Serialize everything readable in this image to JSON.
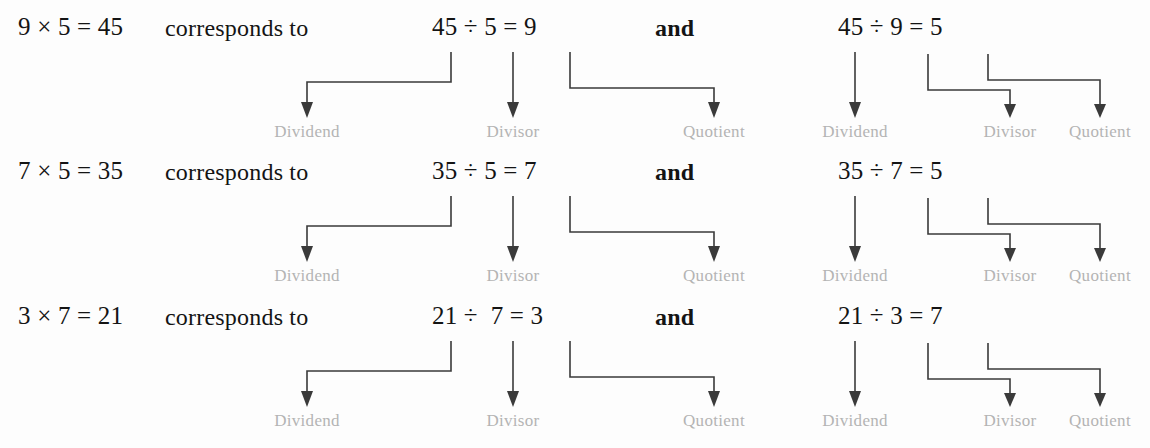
{
  "page": {
    "background_color": "#fdfdfd",
    "text_color": "#141414",
    "label_color": "#b4b4b4",
    "arrow_color": "#3a3a3a"
  },
  "labels": {
    "dividend": "Dividend",
    "divisor": "Divisor",
    "quotient": "Quotient"
  },
  "connectors": {
    "phrase": "corresponds to",
    "conjunction": "and"
  },
  "rows": [
    {
      "multiplication": "9 × 5 = 45",
      "phrase": "corresponds to",
      "division_a": "45 ÷ 5 = 9",
      "conjunction": "and",
      "division_b": "45 ÷ 9 = 5",
      "labels_a": {
        "dividend": "Dividend",
        "divisor": "Divisor",
        "quotient": "Quotient"
      },
      "labels_b": {
        "dividend": "Dividend",
        "divisor": "Divisor",
        "quotient": "Quotient"
      }
    },
    {
      "multiplication": "7 × 5 = 35",
      "phrase": "corresponds to",
      "division_a": "35 ÷ 5 = 7",
      "conjunction": "and",
      "division_b": "35 ÷ 7 = 5",
      "labels_a": {
        "dividend": "Dividend",
        "divisor": "Divisor",
        "quotient": "Quotient"
      },
      "labels_b": {
        "dividend": "Dividend",
        "divisor": "Divisor",
        "quotient": "Quotient"
      }
    },
    {
      "multiplication": "3 × 7 = 21",
      "phrase": "corresponds to",
      "division_a": "21 ÷  7 = 3",
      "conjunction": "and",
      "division_b": "21 ÷ 3 = 7",
      "labels_a": {
        "dividend": "Dividend",
        "divisor": "Divisor",
        "quotient": "Quotient"
      },
      "labels_b": {
        "dividend": "Dividend",
        "divisor": "Divisor",
        "quotient": "Quotient"
      }
    }
  ]
}
